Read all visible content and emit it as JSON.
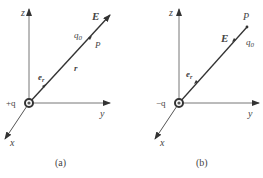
{
  "panels": [
    {
      "caption": "(a)",
      "charge": "+q",
      "axis_x": "x",
      "axis_y": "y",
      "axis_z": "z",
      "field": "E",
      "test_charge": "q",
      "test_sub": "0",
      "point": "P",
      "r_label": "r",
      "unit_vec": "e",
      "unit_sub": "r"
    },
    {
      "caption": "(b)",
      "charge": "−q",
      "axis_x": "x",
      "axis_y": "y",
      "axis_z": "z",
      "field": "E",
      "test_charge": "q",
      "test_sub": "0",
      "point": "P",
      "unit_vec": "e",
      "unit_sub": "r"
    }
  ]
}
